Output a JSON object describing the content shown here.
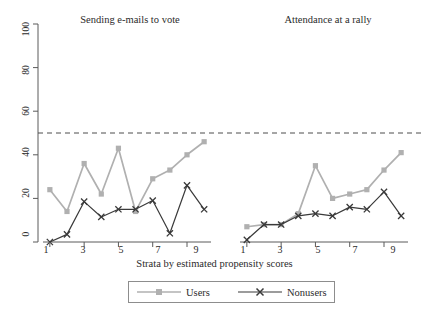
{
  "chart_data": {
    "type": "line",
    "title": "",
    "xlabel": "Strata by estimated propensity scores",
    "ylabel": "Electoral civic engagement (%)",
    "ylim": [
      0,
      100
    ],
    "yticks": [
      0,
      20,
      40,
      60,
      80,
      100
    ],
    "xlim": [
      0.6,
      10.4
    ],
    "xticks": [
      1,
      3,
      5,
      7,
      9
    ],
    "x": [
      1,
      2,
      3,
      4,
      5,
      6,
      7,
      8,
      9,
      10
    ],
    "grid": false,
    "legend_position": "bottom-center",
    "reference_line": {
      "y": 50,
      "style": "dashed",
      "color": "#4d4d4d"
    },
    "panels": [
      {
        "title": "Sending e-mails to vote",
        "series": [
          {
            "name": "Users",
            "color": "#b0b0b0",
            "marker": "square",
            "values": [
              24,
              14,
              36,
              22,
              43,
              14,
              29,
              33,
              40,
              46
            ]
          },
          {
            "name": "Nonusers",
            "color": "#3a3a3a",
            "marker": "x",
            "values": [
              0,
              3.5,
              18.5,
              11.5,
              15,
              15,
              19,
              4,
              26,
              15
            ]
          }
        ]
      },
      {
        "title": "Attendance at a rally",
        "series": [
          {
            "name": "Users",
            "color": "#b0b0b0",
            "marker": "square",
            "values": [
              7,
              8,
              8,
              13,
              35,
              20,
              22,
              24,
              33,
              41
            ]
          },
          {
            "name": "Nonusers",
            "color": "#3a3a3a",
            "marker": "x",
            "values": [
              1,
              8,
              8,
              12,
              13,
              12,
              16,
              15,
              23,
              12
            ]
          }
        ]
      }
    ],
    "legend": [
      {
        "label": "Users",
        "color": "#b0b0b0",
        "marker": "square"
      },
      {
        "label": "Nonusers",
        "color": "#3a3a3a",
        "marker": "x"
      }
    ],
    "ytick_labels": [
      "0",
      "20",
      "40",
      "60",
      "80",
      "100"
    ],
    "xtick_labels": [
      "1",
      "3",
      "5",
      "7",
      "9"
    ]
  },
  "axis": {
    "ylabel": "Electoral civic engagement (%)",
    "xlabel": "Strata by estimated propensity scores"
  },
  "panel_titles": {
    "left": "Sending e-mails to vote",
    "right": "Attendance at a rally"
  },
  "legend": {
    "users_label": "Users",
    "nonusers_label": "Nonusers"
  },
  "ticks": {
    "y": [
      "0",
      "20",
      "40",
      "60",
      "80",
      "100"
    ],
    "x": [
      "1",
      "3",
      "5",
      "7",
      "9"
    ]
  },
  "colors": {
    "users": "#b0b0b0",
    "nonusers": "#3a3a3a",
    "axis": "#5a5a5a",
    "reference_line": "#4d4d4d",
    "text": "#2b2b2b"
  }
}
